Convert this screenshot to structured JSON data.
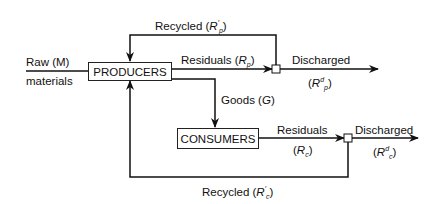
{
  "nodes": {
    "producers": "PRODUCERS",
    "consumers": "CONSUMERS"
  },
  "labels": {
    "raw": "Raw (M)",
    "materials": "materials",
    "recycled_p_text": "Recycled (",
    "recycled_p_sym": "R",
    "recycled_p_sup": "′",
    "recycled_p_sub": "p",
    "residuals_p_text": "Residuals (",
    "residuals_p_sym": "R",
    "residuals_p_sub": "p",
    "discharged_p": "Discharged",
    "discharged_p_sym": "R",
    "discharged_p_sup": "d",
    "discharged_p_sub": "p",
    "goods_text": "Goods (",
    "goods_sym": "G",
    "residuals_c": "Residuals",
    "residuals_c_sym": "R",
    "residuals_c_sub": "c",
    "discharged_c": "Discharged",
    "discharged_c_sym": "R",
    "discharged_c_sup": "d",
    "discharged_c_sub": "c",
    "recycled_c_text": "Recycled (",
    "recycled_c_sym": "R",
    "recycled_c_sup": "′",
    "recycled_c_sub": "c",
    "close_paren": ")",
    "open_paren": "("
  }
}
